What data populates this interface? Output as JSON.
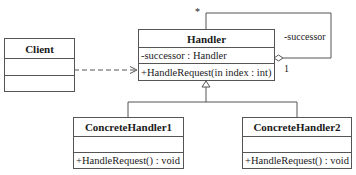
{
  "diagram": {
    "type": "UML class diagram",
    "pattern": "Chain of Responsibility",
    "classes": {
      "client": {
        "name": "Client",
        "attributes": [],
        "operations": []
      },
      "handler": {
        "name": "Handler",
        "attributes": [
          "-successor : Handler"
        ],
        "operations": [
          "+HandleRequest(in index : int)"
        ]
      },
      "concrete1": {
        "name": "ConcreteHandler1",
        "attributes": [],
        "operations": [
          "+HandleRequest() : void"
        ]
      },
      "concrete2": {
        "name": "ConcreteHandler2",
        "attributes": [],
        "operations": [
          "+HandleRequest() : void"
        ]
      }
    },
    "relationships": {
      "dependency": {
        "from": "Client",
        "to": "Handler",
        "style": "dashed-open-arrow"
      },
      "self_aggregation": {
        "role": "-successor",
        "mult_source": "*",
        "mult_target": "1"
      },
      "generalization": [
        {
          "child": "ConcreteHandler1",
          "parent": "Handler"
        },
        {
          "child": "ConcreteHandler2",
          "parent": "Handler"
        }
      ]
    }
  }
}
